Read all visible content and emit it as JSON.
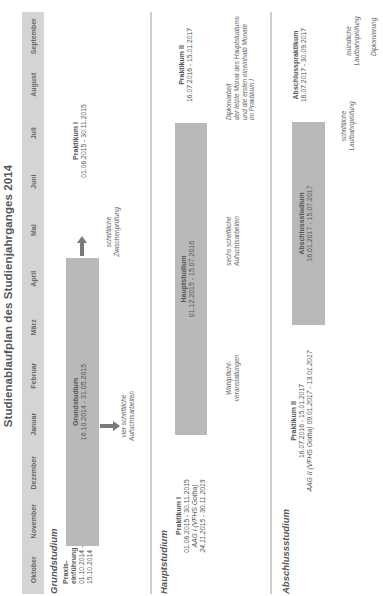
{
  "title": "Studienablaufplan des Studienjahrganges 2014",
  "months": [
    "Oktober",
    "November",
    "Dezember",
    "Januar",
    "Februar",
    "März",
    "April",
    "Mai",
    "Juni",
    "Juli",
    "August",
    "September"
  ],
  "sections": {
    "grund": {
      "label": "Grundstudium",
      "praxis": {
        "title": "Praxis-",
        "title2": "einführung",
        "dates1": "01.10.2014 -",
        "dates2": "15.10.2014"
      },
      "bar": {
        "title": "Grundstudium",
        "dates": "16.10.2014 - 31.05.2015"
      },
      "arrow_note": {
        "line1": "vier schriftliche",
        "line2": "Aufsichtsarbeiten"
      },
      "end_note": {
        "line1": "schriftliche",
        "line2": "Zwischenprüfung"
      },
      "praktikum": {
        "title": "Praktikum I",
        "dates": "01.06.2015 - 30.11.2015"
      }
    },
    "haupt": {
      "label": "Hauptstudium",
      "praktikum": {
        "title": "Praktikum I",
        "dates": "01.06.2015 - 30.11.2015",
        "aag": "AAG I (VFHS Gotha)",
        "aag_dates": "24.11.2015 - 30.11.2015"
      },
      "bar": {
        "title": "Hauptstudium",
        "dates": "01.12.2015 - 15.07.2016"
      },
      "note1": {
        "line1": "Wahlpflicht-",
        "line2": "veranstaltungen"
      },
      "note2": {
        "line1": "sechs schriftliche",
        "line2": "Aufsichtsarbeiten"
      },
      "note3": {
        "line1": "Diplomarbeit",
        "line2": "der letzte Monat des Hauptstudiums",
        "line3": "und die ersten eineinhalb Monate",
        "line4": "im Praktikum I"
      },
      "praktikum2": {
        "title": "Praktikum II",
        "dates": "16.07.2016 - 15.01.2017"
      }
    },
    "abschluss": {
      "label": "Abschlussstudium",
      "praktikum": {
        "title": "Praktikum II",
        "dates": "16.07.2016 - 15.01.2017",
        "aag": "AAG II (VFHS Gotha) 09.01.2017 - 13.01.2017"
      },
      "bar": {
        "title": "Abschlussstudium",
        "dates": "16.01.2017 - 15.07.2017"
      },
      "note1": {
        "line1": "schriftliche",
        "line2": "Laufbahnprüfung"
      },
      "praktikum2": {
        "title": "Abschlusspraktikum",
        "dates": "16.07.2017 - 30.09.2017"
      },
      "note2": {
        "line1": "mündliche",
        "line2": "Laufbahnprüfung"
      },
      "note3": "Diplomierung"
    }
  },
  "colors": {
    "bar": "#b9b9b9",
    "header": "#d4d4d4",
    "arrow": "#7a7a7a"
  }
}
